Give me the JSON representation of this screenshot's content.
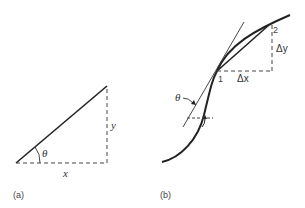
{
  "panels": [
    {
      "id": "a",
      "caption": "(a)",
      "labels": {
        "theta": "θ",
        "x": "x",
        "y": "y"
      }
    },
    {
      "id": "b",
      "caption": "(b)",
      "labels": {
        "theta": "θ",
        "point1": "1",
        "point2": "2",
        "dx": "Δx",
        "dy": "Δy"
      }
    }
  ],
  "colors": {
    "line": "#222222",
    "dashed": "#444444",
    "text": "#333333"
  }
}
